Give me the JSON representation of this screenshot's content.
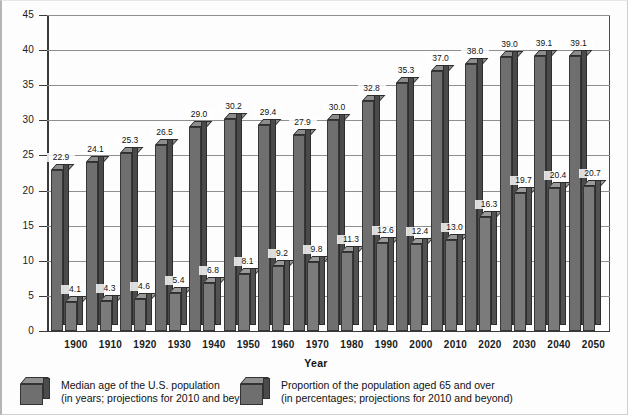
{
  "chart_data": {
    "type": "bar",
    "title": "",
    "subtitle": "",
    "xlabel": "Year",
    "ylabel": "",
    "ylim": [
      0,
      45
    ],
    "ytick_step": 5,
    "yticks": [
      "45",
      "40",
      "35",
      "30",
      "25",
      "20",
      "15",
      "10",
      "5",
      "0"
    ],
    "grid": true,
    "legend_position": "bottom",
    "style": "3d-clustered-column",
    "categories": [
      "1900",
      "1910",
      "1920",
      "1930",
      "1940",
      "1950",
      "1960",
      "1970",
      "1980",
      "1990",
      "2000",
      "2010",
      "2020",
      "2030",
      "2040",
      "2050"
    ],
    "series": [
      {
        "name": "Median age of the U.S. population",
        "note": "(in years; projections for 2010 and beyond)",
        "color": "#6f6f6f",
        "values": [
          22.9,
          24.1,
          25.3,
          26.5,
          29.0,
          30.2,
          29.4,
          27.9,
          30.0,
          32.8,
          35.3,
          37.0,
          38.0,
          39.0,
          39.1,
          39.1
        ],
        "labels": [
          "22.9",
          "24.1",
          "25.3",
          "26.5",
          "29.0",
          "30.2",
          "29.4",
          "27.9",
          "30.0",
          "32.8",
          "35.3",
          "37.0",
          "38.0",
          "39.0",
          "39.1",
          "39.1"
        ]
      },
      {
        "name": "Proportion of the population aged 65 and over",
        "note": "(in percentages; projections for 2010 and beyond)",
        "color": "#7b7b7b",
        "values": [
          4.1,
          4.3,
          4.6,
          5.4,
          6.8,
          8.1,
          9.2,
          9.8,
          11.3,
          12.6,
          12.4,
          13.0,
          16.3,
          19.7,
          20.4,
          20.7
        ],
        "labels": [
          "4.1",
          "4.3",
          "4.6",
          "5.4",
          "6.8",
          "8.1",
          "9.2",
          "9.8",
          "11.3",
          "12.6",
          "12.4",
          "13.0",
          "16.3",
          "19.7",
          "20.4",
          "20.7"
        ]
      }
    ]
  },
  "legend": [
    {
      "line1": "Median age of the U.S. population",
      "line2": "(in years; projections for 2010 and beyond)"
    },
    {
      "line1": "Proportion of the population aged 65 and over",
      "line2": "(in percentages; projections for 2010 and beyond)"
    }
  ],
  "axis": {
    "x_title": "Year"
  }
}
